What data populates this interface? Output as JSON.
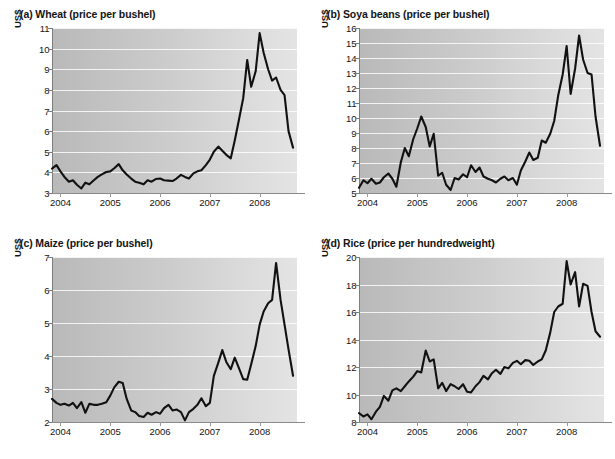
{
  "figure": {
    "panel_count": 4,
    "background": "#ffffff",
    "line_color": "#111111",
    "plot_bg_left": "#b9b9b9",
    "plot_bg_right": "#e4e4e4",
    "gridline_color": "#ffffff"
  },
  "chart_data": [
    {
      "id": "wheat",
      "type": "line",
      "title": "(a) Wheat (price per bushel)",
      "ylabel": "US$",
      "xlabel": "",
      "ylim": [
        3,
        11
      ],
      "yticks": [
        3,
        4,
        5,
        6,
        7,
        8,
        9,
        10,
        11
      ],
      "xlim": [
        2003.83,
        2008.75
      ],
      "xticks": [
        2004,
        2005,
        2006,
        2007,
        2008
      ],
      "xticklabels": [
        "2004",
        "2005",
        "2006",
        "2007",
        "2008"
      ],
      "grid": true,
      "legend": "none",
      "x": [
        2003.83,
        2003.92,
        2004.0,
        2004.08,
        2004.17,
        2004.25,
        2004.33,
        2004.42,
        2004.5,
        2004.58,
        2004.67,
        2004.75,
        2004.83,
        2004.92,
        2005.0,
        2005.08,
        2005.17,
        2005.25,
        2005.33,
        2005.42,
        2005.5,
        2005.58,
        2005.67,
        2005.75,
        2005.83,
        2005.92,
        2006.0,
        2006.08,
        2006.17,
        2006.25,
        2006.33,
        2006.42,
        2006.5,
        2006.58,
        2006.67,
        2006.75,
        2006.83,
        2006.92,
        2007.0,
        2007.08,
        2007.17,
        2007.25,
        2007.33,
        2007.42,
        2007.5,
        2007.58,
        2007.67,
        2007.75,
        2007.83,
        2007.92,
        2008.0,
        2008.08,
        2008.17,
        2008.25,
        2008.33,
        2008.42,
        2008.5,
        2008.58,
        2008.67
      ],
      "y": [
        4.18,
        4.35,
        4.05,
        3.78,
        3.55,
        3.62,
        3.4,
        3.22,
        3.5,
        3.42,
        3.62,
        3.78,
        3.9,
        4.02,
        4.05,
        4.2,
        4.4,
        4.1,
        3.9,
        3.7,
        3.55,
        3.5,
        3.42,
        3.62,
        3.55,
        3.68,
        3.7,
        3.62,
        3.6,
        3.58,
        3.7,
        3.88,
        3.78,
        3.7,
        3.95,
        4.05,
        4.1,
        4.35,
        4.62,
        5.0,
        5.25,
        5.05,
        4.85,
        4.68,
        5.55,
        6.5,
        7.6,
        9.45,
        8.15,
        8.9,
        10.75,
        9.8,
        9.0,
        8.45,
        8.6,
        8.0,
        7.75,
        6.0,
        5.2
      ],
      "series_name": "Wheat price"
    },
    {
      "id": "soya",
      "type": "line",
      "title": "(b) Soya beans (price per bushel)",
      "ylabel": "US$",
      "xlabel": "",
      "ylim": [
        5,
        16
      ],
      "yticks": [
        5,
        6,
        7,
        8,
        9,
        10,
        11,
        12,
        13,
        14,
        15,
        16
      ],
      "xlim": [
        2003.83,
        2008.75
      ],
      "xticks": [
        2004,
        2005,
        2006,
        2007,
        2008
      ],
      "xticklabels": [
        "2004",
        "2005",
        "2006",
        "2007",
        "2008"
      ],
      "grid": true,
      "legend": "none",
      "x": [
        2003.83,
        2003.92,
        2004.0,
        2004.08,
        2004.17,
        2004.25,
        2004.33,
        2004.42,
        2004.5,
        2004.58,
        2004.67,
        2004.75,
        2004.83,
        2004.92,
        2005.0,
        2005.08,
        2005.17,
        2005.25,
        2005.33,
        2005.42,
        2005.5,
        2005.58,
        2005.67,
        2005.75,
        2005.83,
        2005.92,
        2006.0,
        2006.08,
        2006.17,
        2006.25,
        2006.33,
        2006.42,
        2006.5,
        2006.58,
        2006.67,
        2006.75,
        2006.83,
        2006.92,
        2007.0,
        2007.08,
        2007.17,
        2007.25,
        2007.33,
        2007.42,
        2007.5,
        2007.58,
        2007.67,
        2007.75,
        2007.83,
        2007.92,
        2008.0,
        2008.08,
        2008.17,
        2008.25,
        2008.33,
        2008.42,
        2008.5,
        2008.58,
        2008.67
      ],
      "y": [
        5.35,
        5.85,
        5.65,
        5.95,
        5.62,
        5.7,
        6.05,
        6.3,
        5.95,
        5.42,
        7.05,
        8.0,
        7.45,
        8.6,
        9.3,
        10.1,
        9.4,
        8.1,
        8.95,
        6.15,
        6.35,
        5.55,
        5.2,
        6.0,
        5.9,
        6.25,
        6.05,
        6.85,
        6.4,
        6.7,
        6.1,
        5.95,
        5.85,
        5.7,
        5.95,
        6.1,
        5.85,
        6.0,
        5.55,
        6.5,
        7.1,
        7.7,
        7.2,
        7.35,
        8.5,
        8.35,
        8.95,
        9.8,
        11.5,
        12.9,
        14.8,
        11.6,
        13.3,
        15.5,
        13.9,
        13.0,
        12.9,
        10.1,
        8.15
      ],
      "series_name": "Soya beans price"
    },
    {
      "id": "maize",
      "type": "line",
      "title": "(c) Maize (price per bushel)",
      "ylabel": "US$",
      "xlabel": "",
      "ylim": [
        2,
        7
      ],
      "yticks": [
        2,
        3,
        4,
        5,
        6,
        7
      ],
      "xlim": [
        2003.83,
        2008.75
      ],
      "xticks": [
        2004,
        2005,
        2006,
        2007,
        2008
      ],
      "xticklabels": [
        "2004",
        "2005",
        "2006",
        "2007",
        "2008"
      ],
      "grid": true,
      "legend": "none",
      "x": [
        2003.83,
        2003.92,
        2004.0,
        2004.08,
        2004.17,
        2004.25,
        2004.33,
        2004.42,
        2004.5,
        2004.58,
        2004.67,
        2004.75,
        2004.83,
        2004.92,
        2005.0,
        2005.08,
        2005.17,
        2005.25,
        2005.33,
        2005.42,
        2005.5,
        2005.58,
        2005.67,
        2005.75,
        2005.83,
        2005.92,
        2006.0,
        2006.08,
        2006.17,
        2006.25,
        2006.33,
        2006.42,
        2006.5,
        2006.58,
        2006.67,
        2006.75,
        2006.83,
        2006.92,
        2007.0,
        2007.08,
        2007.17,
        2007.25,
        2007.33,
        2007.42,
        2007.5,
        2007.58,
        2007.67,
        2007.75,
        2007.83,
        2007.92,
        2008.0,
        2008.08,
        2008.17,
        2008.25,
        2008.33,
        2008.42,
        2008.5,
        2008.58,
        2008.67
      ],
      "y": [
        2.7,
        2.58,
        2.52,
        2.55,
        2.5,
        2.58,
        2.42,
        2.6,
        2.28,
        2.55,
        2.52,
        2.52,
        2.55,
        2.6,
        2.8,
        3.05,
        3.22,
        3.18,
        2.7,
        2.35,
        2.3,
        2.18,
        2.15,
        2.28,
        2.22,
        2.3,
        2.25,
        2.42,
        2.52,
        2.35,
        2.38,
        2.3,
        2.05,
        2.3,
        2.4,
        2.52,
        2.72,
        2.48,
        2.58,
        3.4,
        3.8,
        4.18,
        3.82,
        3.6,
        3.95,
        3.65,
        3.3,
        3.28,
        3.75,
        4.3,
        4.95,
        5.35,
        5.6,
        5.7,
        6.82,
        5.7,
        4.95,
        4.2,
        3.4
      ],
      "series_name": "Maize price"
    },
    {
      "id": "rice",
      "type": "line",
      "title": "(d) Rice (price per hundredweight)",
      "ylabel": "US$",
      "xlabel": "",
      "ylim": [
        8,
        20
      ],
      "yticks": [
        8,
        10,
        12,
        14,
        16,
        18,
        20
      ],
      "xlim": [
        2003.83,
        2008.75
      ],
      "xticks": [
        2004,
        2005,
        2006,
        2007,
        2008
      ],
      "xticklabels": [
        "2004",
        "2005",
        "2006",
        "2007",
        "2008"
      ],
      "grid": true,
      "legend": "none",
      "x": [
        2003.83,
        2003.92,
        2004.0,
        2004.08,
        2004.17,
        2004.25,
        2004.33,
        2004.42,
        2004.5,
        2004.58,
        2004.67,
        2004.75,
        2004.83,
        2004.92,
        2005.0,
        2005.08,
        2005.17,
        2005.25,
        2005.33,
        2005.42,
        2005.5,
        2005.58,
        2005.67,
        2005.75,
        2005.83,
        2005.92,
        2006.0,
        2006.08,
        2006.17,
        2006.25,
        2006.33,
        2006.42,
        2006.5,
        2006.58,
        2006.67,
        2006.75,
        2006.83,
        2006.92,
        2007.0,
        2007.08,
        2007.17,
        2007.25,
        2007.33,
        2007.42,
        2007.5,
        2007.58,
        2007.67,
        2007.75,
        2007.83,
        2007.92,
        2008.0,
        2008.08,
        2008.17,
        2008.25,
        2008.33,
        2008.42,
        2008.5,
        2008.58,
        2008.67
      ],
      "y": [
        8.65,
        8.4,
        8.55,
        8.2,
        8.75,
        9.1,
        9.9,
        9.55,
        10.3,
        10.45,
        10.25,
        10.6,
        10.95,
        11.3,
        11.7,
        11.6,
        13.2,
        12.4,
        12.55,
        10.45,
        10.85,
        10.25,
        10.75,
        10.6,
        10.4,
        10.75,
        10.2,
        10.15,
        10.6,
        10.9,
        11.35,
        11.1,
        11.55,
        11.8,
        11.5,
        12.0,
        11.9,
        12.3,
        12.45,
        12.2,
        12.5,
        12.45,
        12.15,
        12.4,
        12.55,
        13.2,
        14.5,
        16.0,
        16.4,
        16.6,
        19.7,
        18.0,
        18.9,
        16.4,
        18.05,
        17.9,
        16.0,
        14.6,
        14.2
      ],
      "series_name": "Rice price"
    }
  ]
}
